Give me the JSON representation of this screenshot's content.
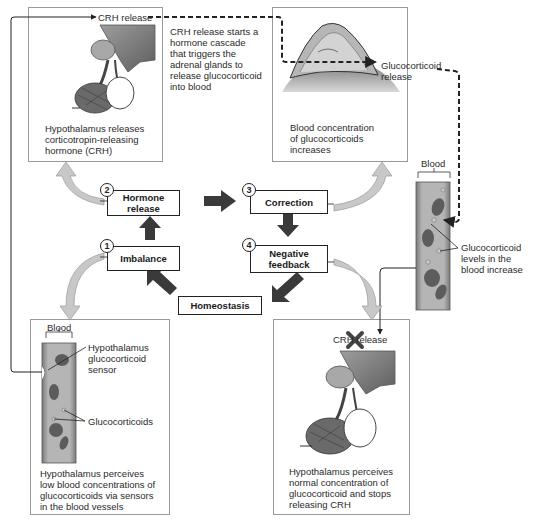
{
  "panels": {
    "top_left": {
      "label": "CRH release",
      "caption": [
        "Hypothalamus releases",
        "corticotropin-releasing",
        "hormone (CRH)"
      ]
    },
    "cascade_note": [
      "CRH release starts a",
      "hormone cascade",
      "that triggers the",
      "adrenal glands to",
      "release glucocorticoid",
      "into blood"
    ],
    "top_right": {
      "label": [
        "Glucocorticoid",
        "release"
      ],
      "caption": [
        "Blood concentration",
        "of glucocorticoids",
        "increases"
      ]
    },
    "right_vessel": {
      "blood_label": "Blood",
      "callout": [
        "Glucocorticoid",
        "levels in the",
        "blood increase"
      ]
    },
    "bottom_left": {
      "blood_label": "Blood",
      "sensor_label": [
        "Hypothalamus",
        "glucocorticoid",
        "sensor"
      ],
      "glucocorticoids_label": "Glucocorticoids",
      "caption": [
        "Hypothalamus perceives",
        "low blood concentrations of",
        "glucocorticoids via sensors",
        "in the blood vessels"
      ]
    },
    "bottom_right": {
      "label": "CRH release",
      "caption": [
        "Hypothalamus perceives",
        "normal concentration of",
        "glucocorticoid and stops",
        "releasing CRH"
      ]
    }
  },
  "cycle": {
    "stages": [
      {
        "num": "1",
        "label": "Imbalance"
      },
      {
        "num": "2",
        "label": "Hormone release"
      },
      {
        "num": "3",
        "label": "Correction"
      },
      {
        "num": "4",
        "label": "Negative feedback"
      }
    ],
    "center": "Homeostasis"
  },
  "colors": {
    "border": "#9a9a9a",
    "stage_border": "#222222",
    "cycle_arrow": "#3a3a3a",
    "callout_arrow": "#c8c8c8",
    "vessel": "#8f8f8f",
    "cell": "#5a5a5a",
    "x_mark": "#444444"
  }
}
